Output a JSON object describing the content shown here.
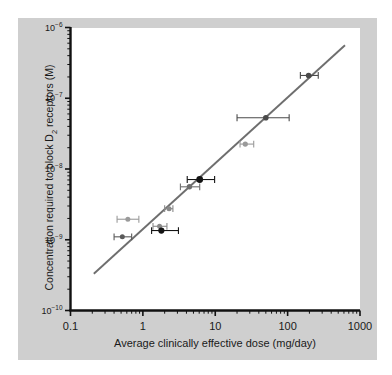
{
  "figure": {
    "background_color": "#cfcfcf",
    "plot_background_color": "#ffffff",
    "axis_color": "#111111",
    "line_color": "#6e6e6e"
  },
  "chart_data": {
    "type": "scatter",
    "title": "",
    "xlabel": "Average clinically effective dose (mg/day)",
    "ylabel": "Concentration required to block D2 receptors (M)",
    "ylabel_parts": {
      "pre": "Concentration required to block D",
      "sub": "2",
      "post": " receptors (M)"
    },
    "xscale": "log",
    "yscale": "log",
    "xlim": [
      0.1,
      1000
    ],
    "ylim": [
      1e-10,
      1e-06
    ],
    "grid": false,
    "legend": "none",
    "xticks": [
      0.1,
      1,
      10,
      100,
      1000
    ],
    "xtick_labels": [
      "0.1",
      "1",
      "10",
      "100",
      "1000"
    ],
    "yticks": [
      1e-06,
      1e-07,
      1e-08,
      1e-09,
      1e-10
    ],
    "ytick_labels": [
      "10−6",
      "10−7",
      "10−8",
      "10−9",
      "10−10"
    ],
    "ytick_label_parts": [
      {
        "base": "10",
        "exp": "−6"
      },
      {
        "base": "10",
        "exp": "−7"
      },
      {
        "base": "10",
        "exp": "−8"
      },
      {
        "base": "10",
        "exp": "−9"
      },
      {
        "base": "10",
        "exp": "−10"
      }
    ],
    "minor_ticks": true,
    "points": [
      {
        "x": 0.62,
        "y": 1.95e-09,
        "xerr_low": 0.44,
        "xerr_high": 0.88,
        "color": "#9a9a9a",
        "size": 5.0
      },
      {
        "x": 0.52,
        "y": 1.1e-09,
        "xerr_low": 0.4,
        "xerr_high": 0.7,
        "color": "#5a5a5a",
        "size": 5.0
      },
      {
        "x": 1.7,
        "y": 1.55e-09,
        "xerr_low": 1.38,
        "xerr_high": 2.15,
        "color": "#8a8a8a",
        "size": 5.0
      },
      {
        "x": 1.8,
        "y": 1.35e-09,
        "xerr_low": 1.32,
        "xerr_high": 3.1,
        "color": "#141414",
        "size": 6.2
      },
      {
        "x": 2.3,
        "y": 2.75e-09,
        "xerr_low": 2.0,
        "xerr_high": 2.6,
        "color": "#8a8a8a",
        "size": 5.0
      },
      {
        "x": 4.4,
        "y": 5.6e-09,
        "xerr_low": 3.3,
        "xerr_high": 6.1,
        "color": "#6e6e6e",
        "size": 5.4
      },
      {
        "x": 6.1,
        "y": 7.1e-09,
        "xerr_low": 4.1,
        "xerr_high": 9.8,
        "color": "#141414",
        "size": 6.8
      },
      {
        "x": 26.0,
        "y": 2.25e-08,
        "xerr_low": 22.0,
        "xerr_high": 34.0,
        "color": "#9a9a9a",
        "size": 5.2
      },
      {
        "x": 50.0,
        "y": 5.3e-08,
        "xerr_low": 20.0,
        "xerr_high": 105.0,
        "color": "#4a4a4a",
        "size": 5.6
      },
      {
        "x": 195.0,
        "y": 2.1e-07,
        "xerr_low": 150.0,
        "xerr_high": 265.0,
        "color": "#4a4a4a",
        "size": 5.6
      }
    ],
    "fit_line": {
      "x_start": 0.21,
      "y_start": 3.3e-10,
      "x_end": 620.0,
      "y_end": 5.6e-07
    }
  }
}
